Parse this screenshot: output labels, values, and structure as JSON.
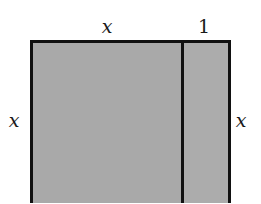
{
  "figure": {
    "fill_color": "#a9a9a9",
    "stroke_color": "#111111",
    "labels": {
      "top_left_width": "x",
      "top_right_width": "1",
      "left_height": "x",
      "right_height": "x"
    },
    "regions": [
      {
        "name": "square",
        "width": "x",
        "height": "x"
      },
      {
        "name": "strip",
        "width": "1",
        "height": "x"
      }
    ]
  }
}
